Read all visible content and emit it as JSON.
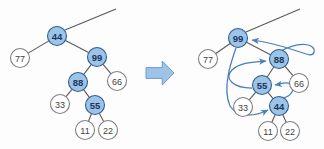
{
  "figure": {
    "background_color": "#fdfdfd",
    "colors": {
      "node_fill_highlight": "#9dc3e6",
      "node_stroke_highlight": "#2e5f95",
      "node_text_highlight": "#17375e",
      "node_fill_plain": "#ffffff",
      "node_stroke_plain": "#7f7f7f",
      "node_text_plain": "#3f3f3f",
      "tree_edge": "#595959",
      "pointer_arrow": "#4a7ebb",
      "block_arrow_fill": "#9dc3e6",
      "block_arrow_stroke": "#6f9bd1"
    },
    "node_radius": 9.5
  },
  "transition_arrow": {
    "icon": "right-block-arrow",
    "direction": "right",
    "x": 146,
    "y": 61,
    "width": 28,
    "height": 24
  },
  "left_tree": {
    "label": "before-restructure",
    "root_stub": {
      "from_x": 65,
      "from_y": 30,
      "to_x": 116,
      "to_y": 9
    },
    "nodes": [
      {
        "id": "L44",
        "label": "44",
        "x": 57,
        "y": 36,
        "highlight": true
      },
      {
        "id": "L77",
        "label": "77",
        "x": 20,
        "y": 58,
        "highlight": false
      },
      {
        "id": "L99",
        "label": "99",
        "x": 97,
        "y": 57,
        "highlight": true
      },
      {
        "id": "L88",
        "label": "88",
        "x": 78,
        "y": 82,
        "highlight": true
      },
      {
        "id": "L66",
        "label": "66",
        "x": 117,
        "y": 81,
        "highlight": false
      },
      {
        "id": "L33",
        "label": "33",
        "x": 60,
        "y": 104,
        "highlight": false
      },
      {
        "id": "L55",
        "label": "55",
        "x": 95,
        "y": 105,
        "highlight": true
      },
      {
        "id": "L11",
        "label": "11",
        "x": 85,
        "y": 130,
        "highlight": false
      },
      {
        "id": "L22",
        "label": "22",
        "x": 108,
        "y": 130,
        "highlight": false
      }
    ],
    "edges": [
      {
        "from": "L44",
        "to": "L77"
      },
      {
        "from": "L44",
        "to": "L99"
      },
      {
        "from": "L99",
        "to": "L88"
      },
      {
        "from": "L99",
        "to": "L66"
      },
      {
        "from": "L88",
        "to": "L33"
      },
      {
        "from": "L88",
        "to": "L55"
      },
      {
        "from": "L55",
        "to": "L11"
      },
      {
        "from": "L55",
        "to": "L22"
      }
    ]
  },
  "right_tree": {
    "label": "after-restructure",
    "root_stub": {
      "from_x": 246,
      "from_y": 32,
      "to_x": 300,
      "to_y": 9
    },
    "nodes": [
      {
        "id": "R99",
        "label": "99",
        "x": 238,
        "y": 38,
        "highlight": true
      },
      {
        "id": "R77",
        "label": "77",
        "x": 208,
        "y": 59,
        "highlight": false
      },
      {
        "id": "R88",
        "label": "88",
        "x": 279,
        "y": 59,
        "highlight": true
      },
      {
        "id": "R55",
        "label": "55",
        "x": 262,
        "y": 85,
        "highlight": true
      },
      {
        "id": "R66",
        "label": "66",
        "x": 299,
        "y": 83,
        "highlight": false
      },
      {
        "id": "R33",
        "label": "33",
        "x": 243,
        "y": 107,
        "highlight": false
      },
      {
        "id": "R44",
        "label": "44",
        "x": 279,
        "y": 106,
        "highlight": true
      },
      {
        "id": "R11",
        "label": "11",
        "x": 268,
        "y": 131,
        "highlight": false
      },
      {
        "id": "R22",
        "label": "22",
        "x": 290,
        "y": 131,
        "highlight": false
      }
    ],
    "edges": [
      {
        "from": "R99",
        "to": "R77"
      },
      {
        "from": "R99",
        "to": "R88"
      },
      {
        "from": "R88",
        "to": "R55"
      },
      {
        "from": "R88",
        "to": "R66"
      },
      {
        "from": "R55",
        "to": "R33"
      },
      {
        "from": "R55",
        "to": "R44"
      },
      {
        "from": "R44",
        "to": "R11"
      },
      {
        "from": "R44",
        "to": "R22"
      }
    ],
    "pointer_arrows": [
      {
        "name": "pointer-88-to-99",
        "path": "M 279 52 C 300 40, 316 44, 314 52 C 312 61, 296 46, 252 40",
        "head_x": 250,
        "head_y": 40,
        "head_angle": 190
      },
      {
        "name": "pointer-55-to-88",
        "path": "M 252 88 C 232 88, 224 78, 232 70 C 240 62, 254 62, 266 61",
        "head_x": 268,
        "head_y": 61,
        "head_angle": 356
      },
      {
        "name": "pointer-44-to-55",
        "path": "M 283 98 C 292 96, 296 88, 290 84 C 286 81, 282 84, 275 85",
        "head_x": 273,
        "head_y": 85,
        "head_angle": 184
      },
      {
        "name": "pointer-99-to-44",
        "path": "M 236 48 C 231 62, 222 88, 230 106 C 238 119, 256 116, 268 110",
        "head_x": 270,
        "head_y": 109,
        "head_angle": 333
      }
    ]
  }
}
